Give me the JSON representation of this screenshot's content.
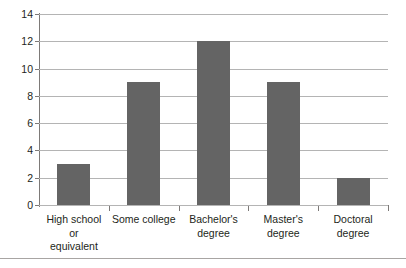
{
  "chart_data": {
    "type": "bar",
    "title": "",
    "xlabel": "",
    "ylabel": "",
    "categories": [
      "High school or equivalent",
      "Some college",
      "Bachelor's degree",
      "Master's degree",
      "Doctoral degree"
    ],
    "category_lines": [
      [
        "High school",
        "or",
        "equivalent"
      ],
      [
        "Some college"
      ],
      [
        "Bachelor's",
        "degree"
      ],
      [
        "Master's",
        "degree"
      ],
      [
        "Doctoral",
        "degree"
      ]
    ],
    "values": [
      3,
      9,
      12,
      9,
      2
    ],
    "ylim": [
      0,
      14
    ],
    "ytick_values": [
      0,
      2,
      4,
      6,
      8,
      10,
      12,
      14
    ],
    "ytick_labels": [
      "0",
      "2",
      "4",
      "6",
      "8",
      "10",
      "12",
      "14"
    ],
    "grid": true,
    "legend": false,
    "colors": {
      "bar_fill": "#646464",
      "gridline": "#b4b4b4",
      "axis_line": "#7d7a78",
      "text": "#231f20",
      "background": "#ffffff",
      "bottom_rule": "#a8a5a3"
    }
  }
}
